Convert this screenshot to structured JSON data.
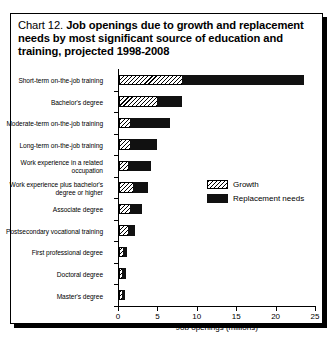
{
  "title": {
    "prefix": "Chart 12. ",
    "main": "Job openings due to growth and replacement needs by most significant source of education and training, projected 1998-2008"
  },
  "legend": {
    "position": "inside-right",
    "items": [
      {
        "name": "growth-swatch",
        "label": "Growth"
      },
      {
        "name": "replacement-swatch",
        "label": "Replacement needs"
      }
    ]
  },
  "axis": {
    "x_title": "Job openings (millions)",
    "x_ticks": [
      "0",
      "5",
      "10",
      "15",
      "20",
      "25"
    ]
  },
  "chart_data": {
    "type": "bar",
    "orientation": "horizontal",
    "stacked": true,
    "title": "Chart 12. Job openings due to growth and replacement needs by most significant source of education and training, projected 1998-2008",
    "xlabel": "Job openings (millions)",
    "ylabel": "",
    "xlim": [
      0,
      25
    ],
    "xticks": [
      0,
      5,
      10,
      15,
      20,
      25
    ],
    "grid": false,
    "legend_position": "inside-right",
    "categories": [
      "Short-term on-the-job training",
      "Bachelor's degree",
      "Moderate-term on-the-job training",
      "Long-term on-the-job training",
      "Work experience in a related occupation",
      "Work experience plus bachelor's degree or higher",
      "Associate degree",
      "Postsecondary vocational training",
      "First professional degree",
      "Doctoral degree",
      "Master's degree"
    ],
    "series": [
      {
        "name": "Growth",
        "values": [
          8.0,
          4.8,
          1.4,
          1.4,
          1.2,
          1.8,
          1.4,
          1.2,
          0.5,
          0.4,
          0.4
        ]
      },
      {
        "name": "Replacement needs",
        "values": [
          15.5,
          3.2,
          5.1,
          3.4,
          2.8,
          1.9,
          1.5,
          0.8,
          0.5,
          0.5,
          0.35
        ]
      }
    ],
    "totals": [
      23.5,
      8.0,
      6.5,
      4.8,
      4.0,
      3.7,
      2.9,
      2.0,
      1.0,
      0.9,
      0.75
    ]
  },
  "colors": {
    "growth": "#ffffff",
    "replacement": "#111111",
    "frame": "#000000"
  }
}
